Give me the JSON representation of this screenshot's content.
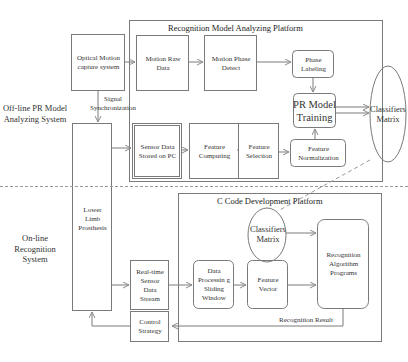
{
  "sections": {
    "offline": "Off-line PR Model Analyzing System",
    "online": "On-line Recognition System"
  },
  "platforms": {
    "recognition_model": "Recognition Model Analyzing Platform",
    "c_code": "C Code Development Platform"
  },
  "nodes": {
    "optical_motion": "Optical Motion capture system",
    "motion_raw": "Motion Raw Data",
    "motion_phase": "Motion Phase Detect",
    "phase_labeling": "Phase Labeling",
    "pr_model": "PR Model Training",
    "classifiers_1": "Classifiers Matrix",
    "sensor_data": "Sensor Data Stored on PC",
    "feature_computing": "Feature Computing",
    "feature_selection": "Feature Selection",
    "feature_normalization": "Feature Normalization",
    "prosthesis": "Lower Limb Prosthesis",
    "classifiers_2": "Classifiers Matrix",
    "recognition_programs": "Recognition Algorithm Programs",
    "realtime_stream": "Real-time Sensor Data Stream",
    "data_processing": "Data Processin g Sliding Window",
    "feature_vector": "Feature Vector",
    "control_strategy": "Control Strategy"
  },
  "edges": {
    "signal_sync": "Signal Synchronization",
    "recognition_result": "Recognition Result"
  },
  "colors": {
    "stroke": "#7a7a7a",
    "text": "#2a2a2a",
    "background": "#ffffff"
  }
}
